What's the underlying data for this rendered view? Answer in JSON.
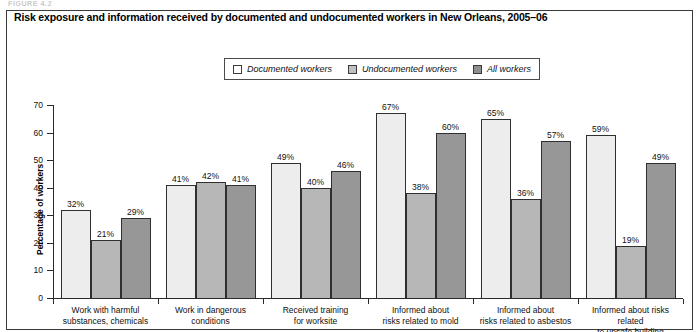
{
  "figure": {
    "kicker": "FIGURE 4.2",
    "title": "Risk exposure and information received by documented and undocumented workers in New Orleans, 2005–06"
  },
  "legend": {
    "items": [
      {
        "label": "Documented workers",
        "color": "#ffffff"
      },
      {
        "label": "Undocumented workers",
        "color": "#c0c0c0"
      },
      {
        "label": "All workers",
        "color": "#8f8f8f"
      }
    ]
  },
  "axes": {
    "y_title": "Percentage of workers",
    "y_ticks": [
      "70",
      "60",
      "50",
      "40",
      "30",
      "20",
      "10",
      "0"
    ]
  },
  "chart_data": {
    "type": "bar",
    "title": "Risk exposure and information received by documented and undocumented workers in New Orleans, 2005–06",
    "xlabel": "",
    "ylabel": "Percentage of workers",
    "ylim": [
      0,
      70
    ],
    "ytick_step": 10,
    "grid": false,
    "legend_position": "top-center",
    "value_suffix": "%",
    "categories": [
      "Work with harmful substances, chemicals",
      "Work in dangerous conditions",
      "Received training for worksite",
      "Informed about risks related to mold",
      "Informed about risks related to asbestos",
      "Informed about risks related to unsafe building"
    ],
    "category_lines": [
      [
        "Work with harmful",
        "substances, chemicals"
      ],
      [
        "Work in dangerous",
        "conditions"
      ],
      [
        "Received training",
        "for worksite"
      ],
      [
        "Informed about",
        "risks related to mold"
      ],
      [
        "Informed about",
        "risks related to asbestos"
      ],
      [
        "Informed about risks related",
        "to unsafe building"
      ]
    ],
    "series": [
      {
        "name": "Documented workers",
        "color": "#ededed",
        "values": [
          32,
          41,
          49,
          67,
          65,
          59
        ],
        "labels": [
          "32%",
          "41%",
          "49%",
          "67%",
          "65%",
          "59%"
        ]
      },
      {
        "name": "Undocumented workers",
        "color": "#b7b7b7",
        "values": [
          21,
          42,
          40,
          38,
          36,
          19
        ],
        "labels": [
          "21%",
          "42%",
          "40%",
          "38%",
          "36%",
          "19%"
        ]
      },
      {
        "name": "All workers",
        "color": "#979797",
        "values": [
          29,
          41,
          46,
          60,
          57,
          49
        ],
        "labels": [
          "29%",
          "41%",
          "46%",
          "60%",
          "57%",
          "49%"
        ]
      }
    ]
  }
}
